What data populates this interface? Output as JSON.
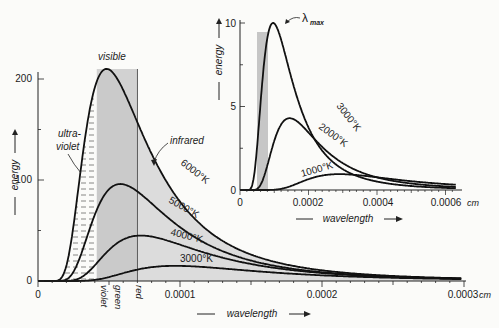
{
  "chart_data": [
    {
      "type": "line",
      "title": "Blackbody radiation curves",
      "xlabel": "wavelength",
      "x_unit": "cm",
      "ylabel": "energy",
      "xlim": [
        0,
        0.0003
      ],
      "ylim": [
        0,
        210
      ],
      "x_ticks": [
        "0",
        "0.0001",
        "0.0002",
        "0.0003 cm"
      ],
      "y_ticks": [
        "0",
        "100",
        "200"
      ],
      "band": {
        "label": "visible",
        "from": 4.14e-05,
        "to": 7e-05
      },
      "band_labels": [
        "violet",
        "green",
        "red"
      ],
      "annotations": [
        "visible",
        "ultra-violet",
        "infrared"
      ],
      "series": [
        {
          "name": "6000°K",
          "temperature": 6000,
          "peak": 210,
          "peak_x": 4.83e-05
        },
        {
          "name": "5000°K",
          "temperature": 5000,
          "peak": 96,
          "peak_x": 5.8e-05
        },
        {
          "name": "4000°K",
          "temperature": 4000,
          "peak": 45,
          "peak_x": 7.25e-05
        },
        {
          "name": "3000°K",
          "temperature": 3000,
          "peak": 15,
          "peak_x": 9.66e-05
        }
      ]
    },
    {
      "type": "line",
      "title": "Inset: low-temperature curves",
      "xlabel": "wavelength",
      "x_unit": "cm",
      "ylabel": "energy",
      "xlim": [
        0,
        0.00064
      ],
      "ylim": [
        0,
        10
      ],
      "x_ticks": [
        "0",
        "0.0002",
        "0.0004",
        "0.0006 cm"
      ],
      "y_ticks": [
        "0",
        "5",
        "10"
      ],
      "annotations": [
        "λmax"
      ],
      "series": [
        {
          "name": "3000°K",
          "temperature": 3000,
          "peak": 10,
          "peak_x": 9.66e-05
        },
        {
          "name": "2000°K",
          "temperature": 2000,
          "peak": 4.3,
          "peak_x": 0.000145
        },
        {
          "name": "1000°K",
          "temperature": 1000,
          "peak": 0.95,
          "peak_x": 0.00029
        }
      ]
    }
  ],
  "labels": {
    "visible": "visible",
    "ultra": "ultra-",
    "violet_uv": "violet",
    "infrared": "infrared",
    "violet": "violet",
    "green": "green",
    "red": "red",
    "energy": "energy",
    "wavelength": "wavelength",
    "lambda": "λ",
    "max": "max",
    "t6000": "6000°K",
    "t5000": "5000°K",
    "t4000": "4000°K",
    "t3000": "3000°K",
    "t3000i": "3000°K",
    "t2000": "2000°K",
    "t1000": "1000°K",
    "mx0": "0",
    "mx1": "0.0001",
    "mx2": "0.0002",
    "mx3": "0.0003",
    "my0": "0",
    "my1": "100",
    "my2": "200",
    "ix0": "0",
    "ix1": "0.0002",
    "ix2": "0.0004",
    "ix3": "0.0006",
    "iy0": "0",
    "iy1": "5",
    "iy2": "10",
    "cm": "cm"
  }
}
